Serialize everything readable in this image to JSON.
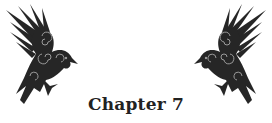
{
  "heading": {
    "title": "Chapter 7"
  },
  "ornaments": [
    {
      "icon": "raven-icon",
      "side": "left",
      "facing": "right"
    },
    {
      "icon": "raven-icon",
      "side": "right",
      "facing": "left"
    }
  ],
  "colors": {
    "ink": "#222222",
    "background": "#ffffff",
    "accent": "#8a8a8a"
  }
}
